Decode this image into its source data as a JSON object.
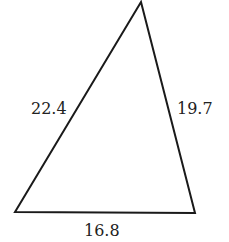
{
  "diagram": {
    "type": "triangle",
    "stroke_color": "#1a1a1a",
    "fill_color": "#ffffff",
    "vertices": {
      "apex": [
        141,
        2
      ],
      "bottom_left": [
        15,
        212
      ],
      "bottom_right": [
        195,
        213
      ]
    },
    "sides": {
      "left": "22.4",
      "right": "19.7",
      "bottom": "16.8"
    }
  }
}
